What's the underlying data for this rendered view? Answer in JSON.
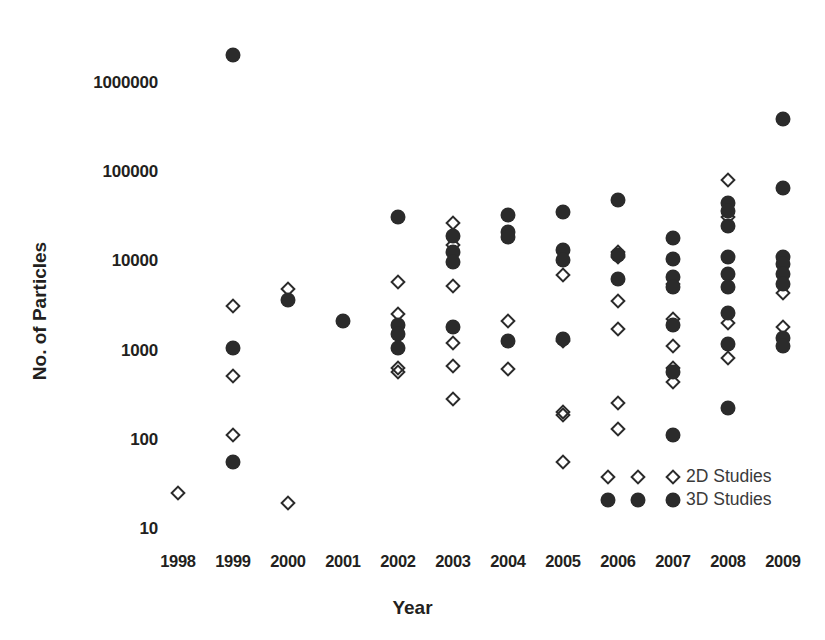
{
  "chart_data": {
    "type": "scatter",
    "title": "",
    "xlabel": "Year",
    "ylabel": "No. of Particles",
    "yscale": "log",
    "ylim": [
      10,
      2000000
    ],
    "ytick_labels": [
      "1000000",
      "100000",
      "10000",
      "1000",
      "100",
      "10"
    ],
    "ytick_values": [
      1000000,
      100000,
      10000,
      1000,
      100,
      10
    ],
    "xtick_labels": [
      "1998",
      "1999",
      "2000",
      "2001",
      "2002",
      "2003",
      "2004",
      "2005",
      "2006",
      "2007",
      "2008",
      "2009"
    ],
    "categories": [
      1998,
      1999,
      2000,
      2001,
      2002,
      2003,
      2004,
      2005,
      2006,
      2007,
      2008,
      2009
    ],
    "grid": false,
    "legend_position": "lower-right",
    "series": [
      {
        "name": "2D Studies",
        "marker": "open-diamond",
        "color": "#2b2b2b",
        "points": [
          {
            "x": 1998,
            "y": 25
          },
          {
            "x": 1999,
            "y": 3100
          },
          {
            "x": 1999,
            "y": 500
          },
          {
            "x": 1999,
            "y": 110
          },
          {
            "x": 2000,
            "y": 4800
          },
          {
            "x": 2000,
            "y": 19
          },
          {
            "x": 2002,
            "y": 5700
          },
          {
            "x": 2002,
            "y": 2500
          },
          {
            "x": 2002,
            "y": 620
          },
          {
            "x": 2002,
            "y": 560
          },
          {
            "x": 2003,
            "y": 26000
          },
          {
            "x": 2003,
            "y": 15000
          },
          {
            "x": 2003,
            "y": 5200
          },
          {
            "x": 2003,
            "y": 1200
          },
          {
            "x": 2003,
            "y": 660
          },
          {
            "x": 2003,
            "y": 280
          },
          {
            "x": 2004,
            "y": 2100
          },
          {
            "x": 2004,
            "y": 600
          },
          {
            "x": 2005,
            "y": 6800
          },
          {
            "x": 2005,
            "y": 1250
          },
          {
            "x": 2005,
            "y": 200
          },
          {
            "x": 2005,
            "y": 185
          },
          {
            "x": 2005,
            "y": 55
          },
          {
            "x": 2006,
            "y": 12500
          },
          {
            "x": 2006,
            "y": 11000
          },
          {
            "x": 2006,
            "y": 3500
          },
          {
            "x": 2006,
            "y": 1700
          },
          {
            "x": 2006,
            "y": 250
          },
          {
            "x": 2006,
            "y": 130
          },
          {
            "x": 2007,
            "y": 5500
          },
          {
            "x": 2007,
            "y": 2200
          },
          {
            "x": 2007,
            "y": 1100
          },
          {
            "x": 2007,
            "y": 620
          },
          {
            "x": 2007,
            "y": 430
          },
          {
            "x": 2008,
            "y": 80000
          },
          {
            "x": 2008,
            "y": 31000
          },
          {
            "x": 2008,
            "y": 2000
          },
          {
            "x": 2008,
            "y": 800
          },
          {
            "x": 2009,
            "y": 4300
          },
          {
            "x": 2009,
            "y": 1800
          }
        ]
      },
      {
        "name": "3D Studies",
        "marker": "filled-circle",
        "color": "#2b2b2b",
        "points": [
          {
            "x": 1999,
            "y": 2000000
          },
          {
            "x": 1999,
            "y": 1050
          },
          {
            "x": 1999,
            "y": 55
          },
          {
            "x": 2000,
            "y": 3600
          },
          {
            "x": 2001,
            "y": 2100
          },
          {
            "x": 2002,
            "y": 31000
          },
          {
            "x": 2002,
            "y": 1900
          },
          {
            "x": 2002,
            "y": 1500
          },
          {
            "x": 2002,
            "y": 1050
          },
          {
            "x": 2003,
            "y": 19000
          },
          {
            "x": 2003,
            "y": 12500
          },
          {
            "x": 2003,
            "y": 9500
          },
          {
            "x": 2003,
            "y": 1800
          },
          {
            "x": 2004,
            "y": 32000
          },
          {
            "x": 2004,
            "y": 21000
          },
          {
            "x": 2004,
            "y": 18500
          },
          {
            "x": 2004,
            "y": 1250
          },
          {
            "x": 2005,
            "y": 35000
          },
          {
            "x": 2005,
            "y": 13000
          },
          {
            "x": 2005,
            "y": 10000
          },
          {
            "x": 2005,
            "y": 1300
          },
          {
            "x": 2006,
            "y": 48000
          },
          {
            "x": 2006,
            "y": 11500
          },
          {
            "x": 2006,
            "y": 6200
          },
          {
            "x": 2007,
            "y": 18000
          },
          {
            "x": 2007,
            "y": 10500
          },
          {
            "x": 2007,
            "y": 6500
          },
          {
            "x": 2007,
            "y": 5000
          },
          {
            "x": 2007,
            "y": 1900
          },
          {
            "x": 2007,
            "y": 560
          },
          {
            "x": 2007,
            "y": 110
          },
          {
            "x": 2008,
            "y": 44000
          },
          {
            "x": 2008,
            "y": 36000
          },
          {
            "x": 2008,
            "y": 24000
          },
          {
            "x": 2008,
            "y": 11000
          },
          {
            "x": 2008,
            "y": 7000
          },
          {
            "x": 2008,
            "y": 5000
          },
          {
            "x": 2008,
            "y": 2600
          },
          {
            "x": 2008,
            "y": 1150
          },
          {
            "x": 2008,
            "y": 220
          },
          {
            "x": 2009,
            "y": 380000
          },
          {
            "x": 2009,
            "y": 65000
          },
          {
            "x": 2009,
            "y": 11000
          },
          {
            "x": 2009,
            "y": 9000
          },
          {
            "x": 2009,
            "y": 7000
          },
          {
            "x": 2009,
            "y": 5500
          },
          {
            "x": 2009,
            "y": 1350
          },
          {
            "x": 2009,
            "y": 1100
          }
        ]
      }
    ],
    "legend": [
      {
        "label": "2D Studies",
        "marker": "open-diamond"
      },
      {
        "label": "3D Studies",
        "marker": "filled-circle"
      }
    ]
  }
}
